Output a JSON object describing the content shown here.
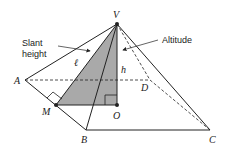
{
  "diagram": {
    "colors": {
      "line": "#222222",
      "shaded": "#a9a9a9",
      "background": "#ffffff"
    },
    "labels": {
      "apex": "V",
      "a": "A",
      "b": "B",
      "c": "C",
      "d": "D",
      "m": "M",
      "o": "O",
      "slant_symbol": "ℓ",
      "altitude_symbol": "h",
      "slant_caption_line1": "Slant",
      "slant_caption_line2": "height",
      "altitude_caption": "Altitude"
    }
  }
}
